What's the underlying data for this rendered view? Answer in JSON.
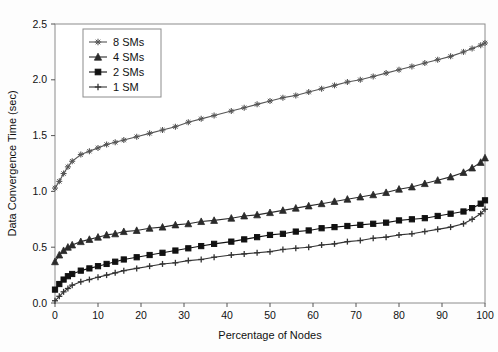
{
  "chart_data": {
    "type": "line",
    "title": "",
    "xlabel": "Percentage of Nodes",
    "ylabel": "Data Convergence Time (sec)",
    "xlim": [
      0,
      100
    ],
    "ylim": [
      0.0,
      2.5
    ],
    "xticks": [
      0,
      10,
      20,
      30,
      40,
      50,
      60,
      70,
      80,
      90,
      100
    ],
    "yticks": [
      0.0,
      0.5,
      1.0,
      1.5,
      2.0,
      2.5
    ],
    "xtick_labels": [
      "0",
      "10",
      "20",
      "30",
      "40",
      "50",
      "60",
      "70",
      "80",
      "90",
      "100"
    ],
    "ytick_labels": [
      "0.0",
      "0.5",
      "1.0",
      "1.5",
      "2.0",
      "2.5"
    ],
    "grid": false,
    "legend_position": "upper-left-inset",
    "x": [
      0,
      1,
      2,
      3,
      4,
      6,
      8,
      10,
      12,
      14,
      16,
      19,
      22,
      25,
      28,
      31,
      34,
      37,
      41,
      44,
      47,
      50,
      53,
      56,
      59,
      62,
      65,
      68,
      71,
      74,
      77,
      80,
      83,
      86,
      89,
      92,
      95,
      97,
      99,
      100
    ],
    "series": [
      {
        "name": "8 SMs",
        "marker": "star",
        "color": "#555555",
        "values": [
          1.03,
          1.09,
          1.16,
          1.22,
          1.27,
          1.33,
          1.36,
          1.39,
          1.42,
          1.44,
          1.46,
          1.49,
          1.52,
          1.55,
          1.58,
          1.62,
          1.65,
          1.68,
          1.72,
          1.75,
          1.78,
          1.81,
          1.84,
          1.86,
          1.89,
          1.92,
          1.95,
          1.98,
          2.0,
          2.03,
          2.06,
          2.09,
          2.12,
          2.15,
          2.18,
          2.21,
          2.25,
          2.28,
          2.31,
          2.33
        ]
      },
      {
        "name": "4 SMs",
        "marker": "triangle",
        "color": "#2b2b2b",
        "values": [
          0.37,
          0.43,
          0.47,
          0.5,
          0.52,
          0.55,
          0.57,
          0.59,
          0.61,
          0.62,
          0.64,
          0.65,
          0.67,
          0.68,
          0.7,
          0.71,
          0.73,
          0.74,
          0.76,
          0.78,
          0.79,
          0.81,
          0.83,
          0.85,
          0.87,
          0.89,
          0.91,
          0.93,
          0.95,
          0.97,
          0.99,
          1.02,
          1.04,
          1.07,
          1.1,
          1.13,
          1.17,
          1.21,
          1.26,
          1.3
        ]
      },
      {
        "name": "2 SMs",
        "marker": "square",
        "color": "#111111",
        "values": [
          0.12,
          0.17,
          0.21,
          0.24,
          0.26,
          0.29,
          0.31,
          0.33,
          0.35,
          0.37,
          0.39,
          0.41,
          0.43,
          0.45,
          0.47,
          0.49,
          0.51,
          0.53,
          0.55,
          0.57,
          0.59,
          0.61,
          0.62,
          0.64,
          0.65,
          0.67,
          0.68,
          0.69,
          0.7,
          0.71,
          0.72,
          0.74,
          0.75,
          0.76,
          0.78,
          0.8,
          0.82,
          0.85,
          0.89,
          0.92
        ]
      },
      {
        "name": "1 SM",
        "marker": "plus",
        "color": "#333333",
        "values": [
          0.02,
          0.06,
          0.1,
          0.13,
          0.16,
          0.19,
          0.21,
          0.23,
          0.25,
          0.27,
          0.29,
          0.31,
          0.33,
          0.35,
          0.36,
          0.38,
          0.39,
          0.41,
          0.43,
          0.44,
          0.45,
          0.46,
          0.48,
          0.49,
          0.5,
          0.52,
          0.53,
          0.55,
          0.56,
          0.58,
          0.59,
          0.61,
          0.62,
          0.64,
          0.66,
          0.68,
          0.71,
          0.75,
          0.8,
          0.84
        ]
      }
    ]
  },
  "legend": {
    "entries": [
      "8 SMs",
      "4 SMs",
      "2 SMs",
      "1 SM"
    ]
  }
}
